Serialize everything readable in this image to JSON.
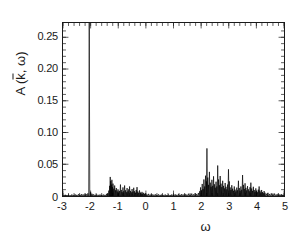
{
  "figure": {
    "background_color": "#ffffff",
    "line_color": "#000000",
    "frame_color": "#1a1a1a"
  },
  "axes": {
    "ylabel_prefix": "A (",
    "ylabel_kbar": "k",
    "ylabel_middle": ", ",
    "ylabel_omega": "ω",
    "ylabel_suffix": ")",
    "xlabel": "ω",
    "ytick_labels": [
      "0",
      "0.05",
      "0.10",
      "0.15",
      "0.20",
      "0.25"
    ],
    "ytick_values": [
      0,
      0.05,
      0.1,
      0.15,
      0.2,
      0.25
    ],
    "xtick_labels": [
      "-3",
      "-2",
      "-1",
      "0",
      "1",
      "2",
      "3",
      "4",
      "5"
    ],
    "xtick_values": [
      -3,
      -2,
      -1,
      0,
      1,
      2,
      3,
      4,
      5
    ]
  },
  "chart_data": {
    "type": "line",
    "title": "",
    "subtitle": "",
    "xlabel": "ω",
    "ylabel": "A ( k̄ , ω )",
    "xlim": [
      -3,
      5
    ],
    "ylim": [
      0,
      0.2725
    ],
    "xticks": [
      -3,
      -2,
      -1,
      0,
      1,
      2,
      3,
      4,
      5
    ],
    "yticks": [
      0,
      0.05,
      0.1,
      0.15,
      0.2,
      0.25
    ],
    "xminor_step": 0.2,
    "yminor_step": 0.01,
    "grid": false,
    "legend": null,
    "annotations": [
      "Dominant quasiparticle delta peak at ω ≈ -2.05 is clipped by the top frame",
      "Incoherent cluster of poles between ω = -1.35 and ω = -0.05",
      "Rich incoherent cluster between ω = 1.95 and ω = 4.35"
    ],
    "series": [
      {
        "name": "A(k̄, ω)",
        "color": "#000000",
        "type": "spikes",
        "baseline": 0,
        "points": [
          [
            -2.92,
            0.002
          ],
          [
            -2.86,
            0.0014
          ],
          [
            -2.8,
            0.0022
          ],
          [
            -2.74,
            0.0013
          ],
          [
            -2.68,
            0.0024
          ],
          [
            -2.62,
            0.0016
          ],
          [
            -2.56,
            0.0026
          ],
          [
            -2.5,
            0.0018
          ],
          [
            -2.44,
            0.0028
          ],
          [
            -2.38,
            0.002
          ],
          [
            -2.32,
            0.0031
          ],
          [
            -2.26,
            0.0022
          ],
          [
            -2.2,
            0.0035
          ],
          [
            -2.15,
            0.0026
          ],
          [
            -2.1,
            0.0042
          ],
          [
            -2.05,
            0.2725
          ],
          [
            -2.0,
            0.006
          ],
          [
            -1.95,
            0.0035
          ],
          [
            -1.9,
            0.0026
          ],
          [
            -1.84,
            0.002
          ],
          [
            -1.78,
            0.0025
          ],
          [
            -1.72,
            0.0018
          ],
          [
            -1.66,
            0.0024
          ],
          [
            -1.6,
            0.0017
          ],
          [
            -1.54,
            0.0023
          ],
          [
            -1.48,
            0.0019
          ],
          [
            -1.42,
            0.003
          ],
          [
            -1.38,
            0.0042
          ],
          [
            -1.34,
            0.0085
          ],
          [
            -1.31,
            0.016
          ],
          [
            -1.29,
            0.03
          ],
          [
            -1.27,
            0.0235
          ],
          [
            -1.25,
            0.018
          ],
          [
            -1.23,
            0.0255
          ],
          [
            -1.21,
            0.014
          ],
          [
            -1.19,
            0.0195
          ],
          [
            -1.16,
            0.0115
          ],
          [
            -1.13,
            0.0165
          ],
          [
            -1.1,
            0.009
          ],
          [
            -1.07,
            0.0125
          ],
          [
            -1.04,
            0.007
          ],
          [
            -1.01,
            0.0105
          ],
          [
            -0.98,
            0.0055
          ],
          [
            -0.95,
            0.008
          ],
          [
            -0.92,
            0.018
          ],
          [
            -0.89,
            0.0095
          ],
          [
            -0.86,
            0.006
          ],
          [
            -0.83,
            0.0135
          ],
          [
            -0.8,
            0.0075
          ],
          [
            -0.77,
            0.0165
          ],
          [
            -0.74,
            0.009
          ],
          [
            -0.71,
            0.006
          ],
          [
            -0.68,
            0.0125
          ],
          [
            -0.65,
            0.0072
          ],
          [
            -0.62,
            0.0105
          ],
          [
            -0.59,
            0.015
          ],
          [
            -0.56,
            0.008
          ],
          [
            -0.53,
            0.0058
          ],
          [
            -0.5,
            0.011
          ],
          [
            -0.47,
            0.0068
          ],
          [
            -0.44,
            0.013
          ],
          [
            -0.41,
            0.0075
          ],
          [
            -0.38,
            0.0052
          ],
          [
            -0.35,
            0.0095
          ],
          [
            -0.32,
            0.014
          ],
          [
            -0.29,
            0.007
          ],
          [
            -0.26,
            0.0048
          ],
          [
            -0.23,
            0.0088
          ],
          [
            -0.2,
            0.0055
          ],
          [
            -0.17,
            0.004
          ],
          [
            -0.14,
            0.0065
          ],
          [
            -0.11,
            0.0038
          ],
          [
            -0.08,
            0.005
          ],
          [
            -0.05,
            0.003
          ],
          [
            -0.02,
            0.0042
          ],
          [
            0.04,
            0.0026
          ],
          [
            0.1,
            0.0034
          ],
          [
            0.16,
            0.0022
          ],
          [
            0.22,
            0.003
          ],
          [
            0.28,
            0.002
          ],
          [
            0.34,
            0.0028
          ],
          [
            0.4,
            0.0019
          ],
          [
            0.46,
            0.0026
          ],
          [
            0.52,
            0.0018
          ],
          [
            0.58,
            0.0025
          ],
          [
            0.64,
            0.0017
          ],
          [
            0.7,
            0.0024
          ],
          [
            0.76,
            0.0016
          ],
          [
            0.82,
            0.0023
          ],
          [
            0.88,
            0.0017
          ],
          [
            0.94,
            0.0025
          ],
          [
            1.0,
            0.0018
          ],
          [
            1.06,
            0.0027
          ],
          [
            1.12,
            0.0019
          ],
          [
            1.18,
            0.0029
          ],
          [
            1.24,
            0.002
          ],
          [
            1.3,
            0.0031
          ],
          [
            1.36,
            0.0021
          ],
          [
            1.42,
            0.0033
          ],
          [
            1.48,
            0.0022
          ],
          [
            1.54,
            0.0036
          ],
          [
            1.6,
            0.0024
          ],
          [
            1.66,
            0.0038
          ],
          [
            1.72,
            0.0026
          ],
          [
            1.78,
            0.0042
          ],
          [
            1.84,
            0.003
          ],
          [
            1.9,
            0.0048
          ],
          [
            1.95,
            0.0075
          ],
          [
            1.98,
            0.0135
          ],
          [
            2.01,
            0.009
          ],
          [
            2.04,
            0.019
          ],
          [
            2.07,
            0.011
          ],
          [
            2.1,
            0.026
          ],
          [
            2.13,
            0.015
          ],
          [
            2.16,
            0.032
          ],
          [
            2.19,
            0.023
          ],
          [
            2.21,
            0.075
          ],
          [
            2.24,
            0.029
          ],
          [
            2.27,
            0.0175
          ],
          [
            2.3,
            0.038
          ],
          [
            2.33,
            0.021
          ],
          [
            2.36,
            0.0145
          ],
          [
            2.39,
            0.0255
          ],
          [
            2.42,
            0.016
          ],
          [
            2.45,
            0.031
          ],
          [
            2.48,
            0.0185
          ],
          [
            2.51,
            0.013
          ],
          [
            2.54,
            0.0225
          ],
          [
            2.57,
            0.015
          ],
          [
            2.6,
            0.048
          ],
          [
            2.63,
            0.026
          ],
          [
            2.66,
            0.017
          ],
          [
            2.69,
            0.0315
          ],
          [
            2.72,
            0.0195
          ],
          [
            2.75,
            0.014
          ],
          [
            2.78,
            0.024
          ],
          [
            2.81,
            0.016
          ],
          [
            2.84,
            0.012
          ],
          [
            2.87,
            0.0205
          ],
          [
            2.9,
            0.0145
          ],
          [
            2.93,
            0.0105
          ],
          [
            2.96,
            0.018
          ],
          [
            2.99,
            0.042
          ],
          [
            3.02,
            0.023
          ],
          [
            3.05,
            0.0135
          ],
          [
            3.08,
            0.0095
          ],
          [
            3.11,
            0.017
          ],
          [
            3.14,
            0.0115
          ],
          [
            3.17,
            0.0082
          ],
          [
            3.2,
            0.015
          ],
          [
            3.23,
            0.01
          ],
          [
            3.26,
            0.0072
          ],
          [
            3.29,
            0.0132
          ],
          [
            3.32,
            0.009
          ],
          [
            3.35,
            0.024
          ],
          [
            3.38,
            0.0125
          ],
          [
            3.41,
            0.0082
          ],
          [
            3.44,
            0.015
          ],
          [
            3.47,
            0.0098
          ],
          [
            3.5,
            0.033
          ],
          [
            3.53,
            0.0175
          ],
          [
            3.56,
            0.011
          ],
          [
            3.59,
            0.02
          ],
          [
            3.62,
            0.0128
          ],
          [
            3.65,
            0.0088
          ],
          [
            3.68,
            0.0155
          ],
          [
            3.71,
            0.0105
          ],
          [
            3.74,
            0.0075
          ],
          [
            3.77,
            0.0138
          ],
          [
            3.8,
            0.021
          ],
          [
            3.83,
            0.0118
          ],
          [
            3.86,
            0.008
          ],
          [
            3.89,
            0.0145
          ],
          [
            3.92,
            0.0095
          ],
          [
            3.95,
            0.0068
          ],
          [
            3.98,
            0.012
          ],
          [
            4.01,
            0.0082
          ],
          [
            4.04,
            0.0058
          ],
          [
            4.07,
            0.01
          ],
          [
            4.1,
            0.015
          ],
          [
            4.13,
            0.0085
          ],
          [
            4.16,
            0.0055
          ],
          [
            4.19,
            0.0095
          ],
          [
            4.22,
            0.0062
          ],
          [
            4.25,
            0.0044
          ],
          [
            4.28,
            0.0078
          ],
          [
            4.31,
            0.0052
          ],
          [
            4.36,
            0.0035
          ],
          [
            4.42,
            0.005
          ],
          [
            4.48,
            0.0032
          ],
          [
            4.54,
            0.0042
          ],
          [
            4.6,
            0.0028
          ],
          [
            4.66,
            0.0038
          ],
          [
            4.72,
            0.0024
          ],
          [
            4.78,
            0.0034
          ],
          [
            4.84,
            0.0022
          ],
          [
            4.9,
            0.003
          ],
          [
            4.96,
            0.002
          ]
        ]
      }
    ]
  }
}
